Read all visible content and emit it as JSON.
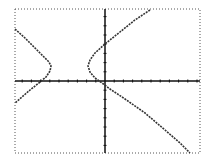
{
  "calculator_graph": {
    "description": "Graphing calculator plot of a rotated hyperbola with two branches",
    "colors": {
      "background": "#ffffff",
      "axes": "#111111",
      "curve": "#333333",
      "border": "#555555"
    },
    "window": {
      "left": 15,
      "top": 9,
      "right": 200,
      "bottom": 153
    },
    "axes": {
      "x_axis_y": 81,
      "y_axis_x": 105,
      "tick_spacing": 9.2
    },
    "curves": {
      "left_branch": [
        [
          15,
          29
        ],
        [
          25,
          38
        ],
        [
          35,
          48
        ],
        [
          44,
          57
        ],
        [
          49,
          62
        ],
        [
          51,
          66
        ],
        [
          50,
          71
        ],
        [
          46,
          77
        ],
        [
          40,
          82
        ],
        [
          30,
          90
        ],
        [
          22,
          97
        ],
        [
          15,
          103
        ]
      ],
      "right_branch": [
        [
          150,
          10
        ],
        [
          135,
          20
        ],
        [
          120,
          32
        ],
        [
          105,
          44
        ],
        [
          95,
          53
        ],
        [
          90,
          60
        ],
        [
          88,
          66
        ],
        [
          90,
          72
        ],
        [
          95,
          78
        ],
        [
          102,
          83
        ],
        [
          110,
          89
        ],
        [
          125,
          99
        ],
        [
          145,
          113
        ],
        [
          165,
          130
        ],
        [
          180,
          143
        ],
        [
          190,
          153
        ]
      ]
    }
  }
}
